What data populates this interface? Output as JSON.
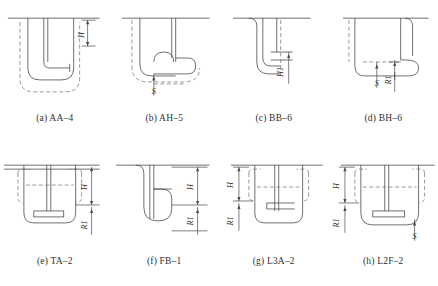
{
  "sheet": {
    "title": "Anchorage and hook detail figures",
    "rows": 2,
    "columns": 4,
    "line_color": "#4a4a4a",
    "dashed_color": "#6e6e6e",
    "text_color": "#2b2b2b",
    "background": "#ffffff"
  },
  "figures": [
    {
      "key": "a",
      "caption": "(a) AA–4",
      "code": "AA–4",
      "dimensions": [
        {
          "label": "H",
          "position": "right",
          "orientation": "vertical"
        }
      ],
      "has_s_symbol": false,
      "hook_style": "u-bend-bottom"
    },
    {
      "key": "b",
      "caption": "(b) AH–5",
      "code": "AH–5",
      "dimensions": [],
      "has_s_symbol": true,
      "hook_style": "side-loop-bottom"
    },
    {
      "key": "c",
      "caption": "(c) BB–6",
      "code": "BB–6",
      "dimensions": [
        {
          "label": "H1",
          "position": "right",
          "orientation": "vertical"
        }
      ],
      "has_s_symbol": false,
      "hook_style": "left-hook-bottom"
    },
    {
      "key": "d",
      "caption": "(d) BH–6",
      "code": "BH–6",
      "dimensions": [
        {
          "label": "R1",
          "position": "bottom-left",
          "orientation": "vertical"
        }
      ],
      "has_s_symbol": true,
      "hook_style": "right-loop-bottom"
    },
    {
      "key": "e",
      "caption": "(e) TA–2",
      "code": "TA–2",
      "dimensions": [
        {
          "label": "H",
          "position": "right",
          "orientation": "vertical"
        },
        {
          "label": "R1",
          "position": "right-lower",
          "orientation": "vertical"
        }
      ],
      "has_s_symbol": false,
      "hook_style": "t-plate-bottom"
    },
    {
      "key": "f",
      "caption": "(f) FB–1",
      "code": "FB–1",
      "dimensions": [
        {
          "label": "H",
          "position": "right",
          "orientation": "vertical"
        },
        {
          "label": "R1",
          "position": "right-lower",
          "orientation": "vertical"
        }
      ],
      "has_s_symbol": false,
      "hook_style": "flag-hook-bottom"
    },
    {
      "key": "g",
      "caption": "(g) L3A–2",
      "code": "L3A–2",
      "dimensions": [
        {
          "label": "H",
          "position": "left",
          "orientation": "vertical"
        },
        {
          "label": "R1",
          "position": "left-lower",
          "orientation": "vertical"
        }
      ],
      "has_s_symbol": false,
      "hook_style": "lateral-bar-bottom"
    },
    {
      "key": "h",
      "caption": "(h) L2F–2",
      "code": "L2F–2",
      "dimensions": [
        {
          "label": "H",
          "position": "left",
          "orientation": "vertical"
        },
        {
          "label": "R1",
          "position": "left-lower",
          "orientation": "vertical"
        }
      ],
      "has_s_symbol": true,
      "hook_style": "t-plate-wide-bottom"
    }
  ]
}
